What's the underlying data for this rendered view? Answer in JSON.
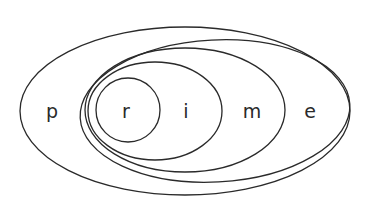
{
  "diagram": {
    "type": "nested-ellipses",
    "word": "prime",
    "colors": {
      "stroke": "#2a2a2a",
      "background": "#ffffff"
    },
    "sets": [
      {
        "id": "p",
        "label": "p",
        "cx": 185,
        "cy": 111,
        "rx": 165,
        "ry": 84,
        "rotate": 0,
        "label_x": 52,
        "label_y": 118
      },
      {
        "id": "e",
        "label": "e",
        "cx": 215,
        "cy": 111,
        "rx": 135,
        "ry": 71,
        "rotate": -3,
        "label_x": 310,
        "label_y": 118
      },
      {
        "id": "m",
        "label": "m",
        "cx": 185,
        "cy": 110,
        "rx": 100,
        "ry": 62,
        "rotate": 0,
        "label_x": 252,
        "label_y": 118
      },
      {
        "id": "i",
        "label": "i",
        "cx": 155,
        "cy": 111,
        "rx": 67,
        "ry": 49,
        "rotate": 0,
        "label_x": 186,
        "label_y": 118
      },
      {
        "id": "r",
        "label": "r",
        "cx": 128,
        "cy": 110,
        "rx": 32,
        "ry": 32,
        "rotate": 0,
        "label_x": 126,
        "label_y": 118
      }
    ]
  }
}
